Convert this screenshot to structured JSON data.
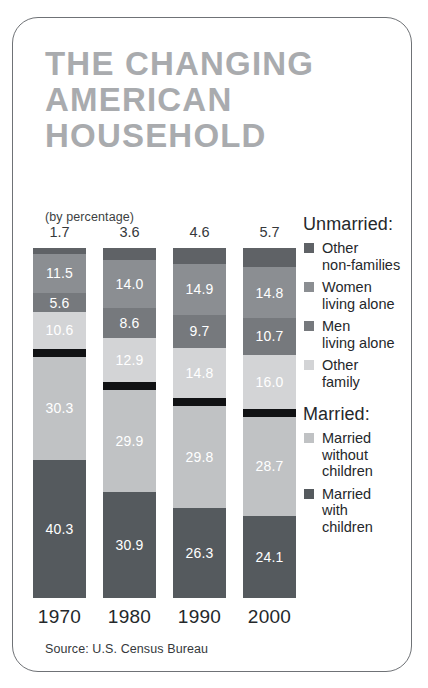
{
  "card": {
    "title_lines": [
      "THE CHANGING",
      "AMERICAN",
      "HOUSEHOLD"
    ],
    "subtitle": "(by percentage)",
    "source": "Source: U.S. Census Bureau",
    "title_color": "#a9abae",
    "border_color": "#6f7276"
  },
  "legend": {
    "group1_label": "Unmarried:",
    "group2_label": "Married:",
    "items": [
      {
        "key": "other_non_families",
        "line1": "Other",
        "line2": "non-families",
        "color": "#5f6266"
      },
      {
        "key": "women_living_alone",
        "line1": "Women",
        "line2": "living alone",
        "color": "#8b8e92"
      },
      {
        "key": "men_living_alone",
        "line1": "Men",
        "line2": "living alone",
        "color": "#76797d"
      },
      {
        "key": "other_family",
        "line1": "Other",
        "line2": "family",
        "color": "#d3d4d6"
      },
      {
        "key": "married_without_children",
        "line1": "Married",
        "line2": "without",
        "line3": "children",
        "color": "#c0c2c4"
      },
      {
        "key": "married_with_children",
        "line1": "Married",
        "line2": "with",
        "line3": "children",
        "color": "#555a5e"
      }
    ]
  },
  "chart_data": {
    "type": "bar",
    "subtype": "stacked-100",
    "title": "THE CHANGING AMERICAN HOUSEHOLD",
    "subtitle": "(by percentage)",
    "xlabel": "",
    "ylabel": "",
    "ylim": [
      0,
      100
    ],
    "grid": false,
    "legend_position": "right",
    "source": "Source: U.S. Census Bureau",
    "categories": [
      "1970",
      "1980",
      "1990",
      "2000"
    ],
    "series": [
      {
        "name": "Other non-families",
        "color": "#5f6266",
        "label_position": "above-bar",
        "values": [
          1.7,
          3.6,
          4.6,
          5.7
        ]
      },
      {
        "name": "Women living alone",
        "color": "#8b8e92",
        "values": [
          11.5,
          14.0,
          14.9,
          14.8
        ]
      },
      {
        "name": "Men living alone",
        "color": "#76797d",
        "values": [
          5.6,
          8.6,
          9.7,
          10.7
        ]
      },
      {
        "name": "Other family",
        "color": "#d3d4d6",
        "values": [
          10.6,
          12.9,
          14.8,
          16.0
        ]
      },
      {
        "name": "Married without children",
        "color": "#c0c2c4",
        "values": [
          30.3,
          29.9,
          29.8,
          28.7
        ]
      },
      {
        "name": "Married with children",
        "color": "#555a5e",
        "values": [
          40.3,
          30.9,
          26.3,
          24.1
        ]
      }
    ],
    "divider": {
      "after_series": "Other family",
      "color": "#111214",
      "note": "separates Unmarried from Married"
    }
  }
}
